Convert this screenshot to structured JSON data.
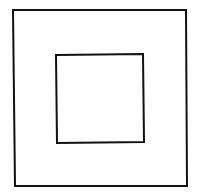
{
  "diagram": {
    "stroke_color": "#111111",
    "background": "#ffffff",
    "shapes": [
      {
        "name": "outer-square",
        "x1": 13,
        "y1": 10,
        "x2": 186,
        "y2": 10,
        "x3": 187,
        "y3": 186,
        "x4": 15,
        "y4": 186,
        "stroke_width": 2
      },
      {
        "name": "inner-square",
        "x1": 56,
        "y1": 55,
        "x2": 143,
        "y2": 54,
        "x3": 144,
        "y3": 142,
        "x4": 57,
        "y4": 143,
        "stroke_width": 2
      }
    ]
  }
}
